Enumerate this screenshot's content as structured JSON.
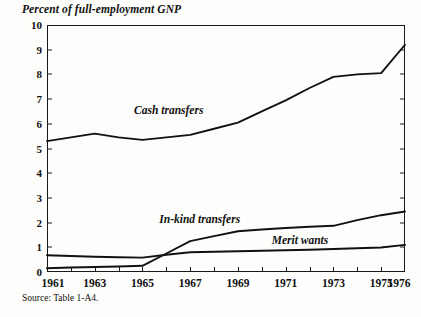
{
  "title": "Percent of full-employment GNP",
  "source_note": "Source: Table 1-A4.",
  "colors": {
    "background": "#fdfdfb",
    "ink": "#1a1a1a",
    "line": "#111111"
  },
  "chart_data": {
    "type": "line",
    "title": "Percent of full-employment GNP",
    "xlabel": "",
    "ylabel": "Percent of full-employment GNP",
    "xlim": [
      1961,
      1976
    ],
    "ylim": [
      0,
      10
    ],
    "grid": false,
    "legend": "inline-annotations",
    "x": [
      1961,
      1962,
      1963,
      1964,
      1965,
      1966,
      1967,
      1968,
      1969,
      1970,
      1971,
      1972,
      1973,
      1974,
      1975,
      1976
    ],
    "y_tick_labels": [
      "0",
      "1",
      "2",
      "3",
      "4",
      "5",
      "6",
      "7",
      "8",
      "9",
      "10"
    ],
    "y_ticks": [
      0,
      1,
      2,
      3,
      4,
      5,
      6,
      7,
      8,
      9,
      10
    ],
    "x_tick_labels": [
      "1961",
      "1963",
      "1965",
      "1967",
      "1969",
      "1971",
      "1973",
      "1975",
      "1976"
    ],
    "x_ticks_labeled": [
      1961,
      1963,
      1965,
      1967,
      1969,
      1971,
      1973,
      1975,
      1976
    ],
    "series": [
      {
        "name": "Cash transfers",
        "label_x": 1966.1,
        "label_y": 6.55,
        "values": [
          5.3,
          5.45,
          5.6,
          5.45,
          5.35,
          5.45,
          5.55,
          5.8,
          6.05,
          6.5,
          6.95,
          7.45,
          7.9,
          8.0,
          8.05,
          9.2
        ]
      },
      {
        "name": "In-kind transfers",
        "label_x": 1967.4,
        "label_y": 2.15,
        "values": [
          0.15,
          0.18,
          0.2,
          0.22,
          0.25,
          0.75,
          1.25,
          1.45,
          1.65,
          1.72,
          1.78,
          1.83,
          1.87,
          2.1,
          2.3,
          2.45
        ]
      },
      {
        "name": "Merit wants",
        "label_x": 1971.6,
        "label_y": 1.3,
        "values": [
          0.68,
          0.65,
          0.62,
          0.6,
          0.58,
          0.7,
          0.8,
          0.82,
          0.84,
          0.86,
          0.88,
          0.9,
          0.93,
          0.96,
          0.99,
          1.1
        ]
      }
    ]
  }
}
